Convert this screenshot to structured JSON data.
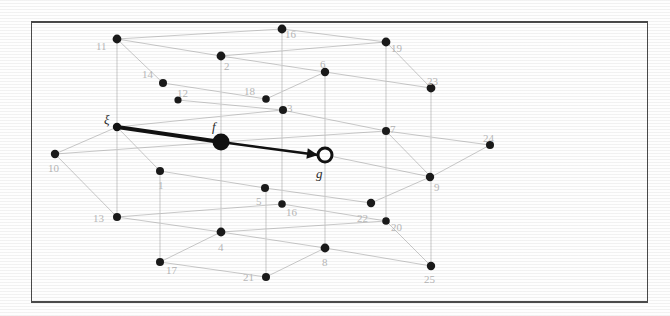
{
  "figure": {
    "background_color": "#fefefe",
    "frame_color": "#4a4a4a",
    "edge_color": "#c9c9c9",
    "node_color": "#1a1a1a",
    "node_label_color": "#b9b9b9",
    "highlight_color": "#111111"
  },
  "greek_labels": [
    {
      "id": "xi",
      "text": "ξ",
      "x": 104,
      "y": 113
    },
    {
      "id": "f",
      "text": "f",
      "x": 212,
      "y": 120
    },
    {
      "id": "g",
      "text": "g",
      "x": 316,
      "y": 167
    }
  ],
  "special_nodes": [
    {
      "id": "xi-node",
      "name": "xi-endpoint",
      "x": 117,
      "y": 127,
      "r": 4.2,
      "style": "filled"
    },
    {
      "id": "f-node",
      "name": "f-source-node",
      "x": 221,
      "y": 142,
      "r": 8.5,
      "style": "filled-large"
    },
    {
      "id": "g-node",
      "name": "g-target-node",
      "x": 325,
      "y": 155,
      "r": 7.0,
      "style": "open"
    }
  ],
  "highlight_edges": [
    {
      "id": "xi-to-f",
      "x1": 117,
      "y1": 127,
      "x2": 221,
      "y2": 142,
      "width": 4.0
    },
    {
      "id": "f-to-g",
      "x1": 221,
      "y1": 142,
      "x2": 318,
      "y2": 155,
      "width": 2.4
    }
  ],
  "arrow": {
    "id": "arrow-head-to-g",
    "tip_x": 318,
    "tip_y": 155,
    "angle_deg": 7.6,
    "size": 11
  },
  "nodes": [
    {
      "n": "1",
      "x": 160,
      "y": 171,
      "lx": 158,
      "ly": 180,
      "r": 4.0
    },
    {
      "n": "2",
      "x": 221,
      "y": 56,
      "lx": 224,
      "ly": 61,
      "r": 4.4
    },
    {
      "n": "3",
      "x": 283,
      "y": 110,
      "lx": 287,
      "ly": 103,
      "r": 4.0
    },
    {
      "n": "4",
      "x": 221,
      "y": 232,
      "lx": 218,
      "ly": 242,
      "r": 4.4
    },
    {
      "n": "5",
      "x": 265,
      "y": 188,
      "lx": 256,
      "ly": 196,
      "r": 4.0
    },
    {
      "n": "6",
      "x": 325,
      "y": 72,
      "lx": 320,
      "ly": 59,
      "r": 4.2
    },
    {
      "n": "7",
      "x": 386,
      "y": 131,
      "lx": 390,
      "ly": 124,
      "r": 4.0
    },
    {
      "n": "8",
      "x": 325,
      "y": 248,
      "lx": 322,
      "ly": 257,
      "r": 4.4
    },
    {
      "n": "9",
      "x": 430,
      "y": 177,
      "lx": 434,
      "ly": 182,
      "r": 4.2
    },
    {
      "n": "10",
      "x": 55,
      "y": 154,
      "lx": 48,
      "ly": 163,
      "r": 4.2
    },
    {
      "n": "11",
      "x": 117,
      "y": 39,
      "lx": 96,
      "ly": 41,
      "r": 4.4
    },
    {
      "n": "12",
      "x": 178,
      "y": 100,
      "lx": 177,
      "ly": 88,
      "r": 3.6
    },
    {
      "n": "13",
      "x": 117,
      "y": 217,
      "lx": 93,
      "ly": 213,
      "r": 4.0
    },
    {
      "n": "14",
      "x": 163,
      "y": 83,
      "lx": 142,
      "ly": 69,
      "r": 4.0
    },
    {
      "n": "16",
      "x": 282,
      "y": 29,
      "lx": 285,
      "ly": 29,
      "r": 4.4
    },
    {
      "n": "16",
      "x": 282,
      "y": 204,
      "lx": 286,
      "ly": 207,
      "r": 3.8
    },
    {
      "n": "17",
      "x": 160,
      "y": 262,
      "lx": 166,
      "ly": 265,
      "r": 4.0
    },
    {
      "n": "18",
      "x": 266,
      "y": 99,
      "lx": 244,
      "ly": 86,
      "r": 3.8
    },
    {
      "n": "19",
      "x": 386,
      "y": 42,
      "lx": 391,
      "ly": 43,
      "r": 4.4
    },
    {
      "n": "20",
      "x": 386,
      "y": 221,
      "lx": 391,
      "ly": 222,
      "r": 3.8
    },
    {
      "n": "21",
      "x": 266,
      "y": 277,
      "lx": 243,
      "ly": 272,
      "r": 4.0
    },
    {
      "n": "22",
      "x": 371,
      "y": 203,
      "lx": 357,
      "ly": 213,
      "r": 4.2
    },
    {
      "n": "23",
      "x": 431,
      "y": 88,
      "lx": 427,
      "ly": 76,
      "r": 4.4
    },
    {
      "n": "24",
      "x": 490,
      "y": 145,
      "lx": 483,
      "ly": 133,
      "r": 4.0
    },
    {
      "n": "25",
      "x": 431,
      "y": 266,
      "lx": 424,
      "ly": 274,
      "r": 4.2
    }
  ],
  "edges": [
    {
      "x1": 117,
      "y1": 39,
      "x2": 282,
      "y2": 29
    },
    {
      "x1": 117,
      "y1": 39,
      "x2": 221,
      "y2": 56
    },
    {
      "x1": 221,
      "y1": 56,
      "x2": 386,
      "y2": 42
    },
    {
      "x1": 221,
      "y1": 56,
      "x2": 325,
      "y2": 72
    },
    {
      "x1": 282,
      "y1": 29,
      "x2": 386,
      "y2": 42
    },
    {
      "x1": 325,
      "y1": 72,
      "x2": 431,
      "y2": 88
    },
    {
      "x1": 386,
      "y1": 42,
      "x2": 431,
      "y2": 88
    },
    {
      "x1": 117,
      "y1": 39,
      "x2": 117,
      "y2": 127
    },
    {
      "x1": 282,
      "y1": 29,
      "x2": 282,
      "y2": 110
    },
    {
      "x1": 221,
      "y1": 56,
      "x2": 221,
      "y2": 142
    },
    {
      "x1": 325,
      "y1": 72,
      "x2": 325,
      "y2": 155
    },
    {
      "x1": 386,
      "y1": 42,
      "x2": 386,
      "y2": 131
    },
    {
      "x1": 431,
      "y1": 88,
      "x2": 431,
      "y2": 177
    },
    {
      "x1": 117,
      "y1": 127,
      "x2": 282,
      "y2": 110
    },
    {
      "x1": 117,
      "y1": 127,
      "x2": 221,
      "y2": 142
    },
    {
      "x1": 221,
      "y1": 142,
      "x2": 386,
      "y2": 131
    },
    {
      "x1": 221,
      "y1": 142,
      "x2": 325,
      "y2": 155
    },
    {
      "x1": 282,
      "y1": 110,
      "x2": 386,
      "y2": 131
    },
    {
      "x1": 325,
      "y1": 155,
      "x2": 431,
      "y2": 177
    },
    {
      "x1": 386,
      "y1": 131,
      "x2": 490,
      "y2": 145
    },
    {
      "x1": 386,
      "y1": 131,
      "x2": 431,
      "y2": 177
    },
    {
      "x1": 431,
      "y1": 177,
      "x2": 490,
      "y2": 145
    },
    {
      "x1": 55,
      "y1": 154,
      "x2": 221,
      "y2": 142
    },
    {
      "x1": 55,
      "y1": 154,
      "x2": 117,
      "y2": 127
    },
    {
      "x1": 55,
      "y1": 154,
      "x2": 117,
      "y2": 217
    },
    {
      "x1": 117,
      "y1": 127,
      "x2": 117,
      "y2": 217
    },
    {
      "x1": 117,
      "y1": 217,
      "x2": 282,
      "y2": 204
    },
    {
      "x1": 117,
      "y1": 217,
      "x2": 221,
      "y2": 232
    },
    {
      "x1": 221,
      "y1": 232,
      "x2": 386,
      "y2": 221
    },
    {
      "x1": 221,
      "y1": 232,
      "x2": 325,
      "y2": 248
    },
    {
      "x1": 221,
      "y1": 142,
      "x2": 221,
      "y2": 232
    },
    {
      "x1": 282,
      "y1": 204,
      "x2": 386,
      "y2": 221
    },
    {
      "x1": 325,
      "y1": 155,
      "x2": 325,
      "y2": 248
    },
    {
      "x1": 386,
      "y1": 131,
      "x2": 386,
      "y2": 221
    },
    {
      "x1": 325,
      "y1": 248,
      "x2": 431,
      "y2": 266
    },
    {
      "x1": 431,
      "y1": 177,
      "x2": 431,
      "y2": 266
    },
    {
      "x1": 386,
      "y1": 221,
      "x2": 431,
      "y2": 266
    },
    {
      "x1": 160,
      "y1": 262,
      "x2": 221,
      "y2": 232
    },
    {
      "x1": 160,
      "y1": 262,
      "x2": 266,
      "y2": 277
    },
    {
      "x1": 266,
      "y1": 277,
      "x2": 325,
      "y2": 248
    },
    {
      "x1": 160,
      "y1": 171,
      "x2": 265,
      "y2": 188
    },
    {
      "x1": 160,
      "y1": 171,
      "x2": 117,
      "y2": 127
    },
    {
      "x1": 265,
      "y1": 188,
      "x2": 371,
      "y2": 203
    },
    {
      "x1": 163,
      "y1": 83,
      "x2": 266,
      "y2": 99
    },
    {
      "x1": 163,
      "y1": 83,
      "x2": 117,
      "y2": 39
    },
    {
      "x1": 178,
      "y1": 100,
      "x2": 282,
      "y2": 110
    },
    {
      "x1": 266,
      "y1": 99,
      "x2": 325,
      "y2": 72
    },
    {
      "x1": 371,
      "y1": 203,
      "x2": 430,
      "y2": 177
    },
    {
      "x1": 266,
      "y1": 277,
      "x2": 266,
      "y2": 188
    },
    {
      "x1": 282,
      "y1": 204,
      "x2": 282,
      "y2": 110
    },
    {
      "x1": 160,
      "y1": 262,
      "x2": 160,
      "y2": 171
    }
  ]
}
